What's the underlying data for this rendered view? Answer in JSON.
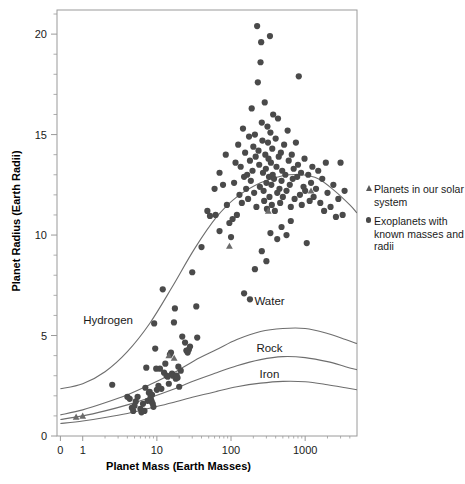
{
  "chart_data": {
    "type": "scatter",
    "title": "",
    "xlabel": "Planet Mass (Earth Masses)",
    "ylabel": "Planet Radius (Earth Radii)",
    "xscale": "log",
    "yscale": "linear",
    "xlim": [
      0.45,
      5000
    ],
    "ylim": [
      0,
      21.2
    ],
    "grid": false,
    "legend_position": "right-outside",
    "xticks": [
      {
        "value": 0.5,
        "label": "0"
      },
      {
        "value": 1,
        "label": "1"
      },
      {
        "value": 10,
        "label": "10"
      },
      {
        "value": 100,
        "label": "100"
      },
      {
        "value": 1000,
        "label": "1000"
      }
    ],
    "yticks_major": [
      {
        "value": 0,
        "label": "0"
      },
      {
        "value": 5,
        "label": "5"
      },
      {
        "value": 10,
        "label": "10"
      },
      {
        "value": 15,
        "label": "15"
      },
      {
        "value": 20,
        "label": "20"
      }
    ],
    "yticks_minor": [
      1,
      2,
      3,
      4,
      6,
      7,
      8,
      9,
      11,
      12,
      13,
      14,
      16,
      17,
      18,
      19,
      21
    ],
    "legend": [
      {
        "marker": "triangle-icon",
        "label": "Planets in our solar system"
      },
      {
        "marker": "circle-icon",
        "label": "Exoplanets with known masses and radii"
      }
    ],
    "annotations": [
      {
        "text": "Hydrogen",
        "x": 2.2,
        "y": 5.6
      },
      {
        "text": "Water",
        "x": 330,
        "y": 6.5
      },
      {
        "text": "Rock",
        "x": 330,
        "y": 4.2
      },
      {
        "text": "Iron",
        "x": 330,
        "y": 2.9
      }
    ],
    "curves": [
      {
        "name": "Hydrogen",
        "points": [
          [
            0.5,
            2.35
          ],
          [
            1,
            2.6
          ],
          [
            2,
            3.2
          ],
          [
            4,
            4.2
          ],
          [
            8,
            5.6
          ],
          [
            16,
            7.4
          ],
          [
            32,
            9.3
          ],
          [
            64,
            10.9
          ],
          [
            120,
            11.9
          ],
          [
            250,
            12.6
          ],
          [
            500,
            12.95
          ],
          [
            900,
            13.0
          ],
          [
            1500,
            12.8
          ],
          [
            2500,
            12.2
          ],
          [
            4000,
            11.5
          ],
          [
            5000,
            11.1
          ]
        ]
      },
      {
        "name": "Water",
        "points": [
          [
            0.5,
            1.05
          ],
          [
            1,
            1.3
          ],
          [
            2,
            1.65
          ],
          [
            4,
            2.05
          ],
          [
            8,
            2.55
          ],
          [
            16,
            3.1
          ],
          [
            32,
            3.75
          ],
          [
            64,
            4.3
          ],
          [
            120,
            4.8
          ],
          [
            250,
            5.2
          ],
          [
            500,
            5.35
          ],
          [
            1000,
            5.35
          ],
          [
            2000,
            5.1
          ],
          [
            3500,
            4.8
          ],
          [
            5000,
            4.6
          ]
        ]
      },
      {
        "name": "Rock",
        "points": [
          [
            0.5,
            0.82
          ],
          [
            1,
            1.0
          ],
          [
            2,
            1.25
          ],
          [
            4,
            1.55
          ],
          [
            8,
            1.9
          ],
          [
            16,
            2.3
          ],
          [
            32,
            2.75
          ],
          [
            64,
            3.15
          ],
          [
            120,
            3.5
          ],
          [
            250,
            3.8
          ],
          [
            500,
            3.95
          ],
          [
            1000,
            3.9
          ],
          [
            2000,
            3.7
          ],
          [
            3500,
            3.45
          ],
          [
            5000,
            3.3
          ]
        ]
      },
      {
        "name": "Iron",
        "points": [
          [
            0.5,
            0.62
          ],
          [
            1,
            0.75
          ],
          [
            2,
            0.92
          ],
          [
            4,
            1.12
          ],
          [
            8,
            1.38
          ],
          [
            16,
            1.65
          ],
          [
            32,
            1.95
          ],
          [
            64,
            2.22
          ],
          [
            120,
            2.45
          ],
          [
            250,
            2.63
          ],
          [
            500,
            2.72
          ],
          [
            1000,
            2.7
          ],
          [
            2000,
            2.55
          ],
          [
            3500,
            2.4
          ],
          [
            5000,
            2.3
          ]
        ]
      }
    ],
    "solar_system_points": [
      [
        0.815,
        0.95
      ],
      [
        1.0,
        1.0
      ],
      [
        14.5,
        4.0
      ],
      [
        17.1,
        3.88
      ],
      [
        95.2,
        9.45
      ],
      [
        317.8,
        11.2
      ],
      [
        1200,
        12.2
      ]
    ],
    "exoplanet_points": [
      [
        2.5,
        2.55
      ],
      [
        4.0,
        1.95
      ],
      [
        4.3,
        1.85
      ],
      [
        4.6,
        1.4
      ],
      [
        4.8,
        1.25
      ],
      [
        5.0,
        1.5
      ],
      [
        5.2,
        1.72
      ],
      [
        5.5,
        1.95
      ],
      [
        6.0,
        1.35
      ],
      [
        6.2,
        1.18
      ],
      [
        6.5,
        1.6
      ],
      [
        6.8,
        1.25
      ],
      [
        7.0,
        2.4
      ],
      [
        7.2,
        3.4
      ],
      [
        7.5,
        1.75
      ],
      [
        7.8,
        2.15
      ],
      [
        8.0,
        2.2
      ],
      [
        8.2,
        1.9
      ],
      [
        8.4,
        1.78
      ],
      [
        8.5,
        1.7
      ],
      [
        8.6,
        2.05
      ],
      [
        8.8,
        1.6
      ],
      [
        9.0,
        1.45
      ],
      [
        9.2,
        5.6
      ],
      [
        9.5,
        4.35
      ],
      [
        9.8,
        3.35
      ],
      [
        10.0,
        2.3
      ],
      [
        10.5,
        2.5
      ],
      [
        11.0,
        3.35
      ],
      [
        11.5,
        2.35
      ],
      [
        12.0,
        7.3
      ],
      [
        12.5,
        3.15
      ],
      [
        13.0,
        3.6
      ],
      [
        13.5,
        3.0
      ],
      [
        14.0,
        2.95
      ],
      [
        14.5,
        2.6
      ],
      [
        15.0,
        4.05
      ],
      [
        15.5,
        4.15
      ],
      [
        16.0,
        3.1
      ],
      [
        16.5,
        3.0
      ],
      [
        17.0,
        5.65
      ],
      [
        17.5,
        6.35
      ],
      [
        18.0,
        2.85
      ],
      [
        18.5,
        3.0
      ],
      [
        19.0,
        2.9
      ],
      [
        20.0,
        2.45
      ],
      [
        22.0,
        4.95
      ],
      [
        24.0,
        4.65
      ],
      [
        25.0,
        4.25
      ],
      [
        26.0,
        4.15
      ],
      [
        27.0,
        4.3
      ],
      [
        30.0,
        8.15
      ],
      [
        34.0,
        6.45
      ],
      [
        40.0,
        9.4
      ],
      [
        48.0,
        11.2
      ],
      [
        52.0,
        10.95
      ],
      [
        60.0,
        12.3
      ],
      [
        70.0,
        13.1
      ],
      [
        78.0,
        12.5
      ],
      [
        85.0,
        14.0
      ],
      [
        95.0,
        10.6
      ],
      [
        100.0,
        9.9
      ],
      [
        110.0,
        12.6
      ],
      [
        115.0,
        13.6
      ],
      [
        120.0,
        11.0
      ],
      [
        125.0,
        14.5
      ],
      [
        130.0,
        12.0
      ],
      [
        135.0,
        13.4
      ],
      [
        140.0,
        11.6
      ],
      [
        145.0,
        15.3
      ],
      [
        150.0,
        12.9
      ],
      [
        155.0,
        14.1
      ],
      [
        160.0,
        12.3
      ],
      [
        165.0,
        13.0
      ],
      [
        170.0,
        11.8
      ],
      [
        175.0,
        14.9
      ],
      [
        180.0,
        13.7
      ],
      [
        185.0,
        12.7
      ],
      [
        190.0,
        16.3
      ],
      [
        195.0,
        13.2
      ],
      [
        200.0,
        14.4
      ],
      [
        205.0,
        12.1
      ],
      [
        210.0,
        15.0
      ],
      [
        215.0,
        13.9
      ],
      [
        220.0,
        11.4
      ],
      [
        225.0,
        20.4
      ],
      [
        230.0,
        17.6
      ],
      [
        235.0,
        14.2
      ],
      [
        240.0,
        13.5
      ],
      [
        245.0,
        12.4
      ],
      [
        250.0,
        18.6
      ],
      [
        255.0,
        19.6
      ],
      [
        260.0,
        15.6
      ],
      [
        265.0,
        14.7
      ],
      [
        270.0,
        13.1
      ],
      [
        275.0,
        12.2
      ],
      [
        280.0,
        11.7
      ],
      [
        285.0,
        16.6
      ],
      [
        290.0,
        14.0
      ],
      [
        295.0,
        13.3
      ],
      [
        300.0,
        12.6
      ],
      [
        305.0,
        11.3
      ],
      [
        310.0,
        15.4
      ],
      [
        315.0,
        14.6
      ],
      [
        320.0,
        13.8
      ],
      [
        325.0,
        12.9
      ],
      [
        330.0,
        11.9
      ],
      [
        335.0,
        19.9
      ],
      [
        340.0,
        15.1
      ],
      [
        345.0,
        13.6
      ],
      [
        350.0,
        12.5
      ],
      [
        355.0,
        11.5
      ],
      [
        360.0,
        14.3
      ],
      [
        365.0,
        13.0
      ],
      [
        370.0,
        16.0
      ],
      [
        380.0,
        12.8
      ],
      [
        390.0,
        11.2
      ],
      [
        400.0,
        14.8
      ],
      [
        410.0,
        13.4
      ],
      [
        420.0,
        12.1
      ],
      [
        430.0,
        15.8
      ],
      [
        440.0,
        13.9
      ],
      [
        450.0,
        12.3
      ],
      [
        460.0,
        11.6
      ],
      [
        470.0,
        14.1
      ],
      [
        480.0,
        12.7
      ],
      [
        490.0,
        13.2
      ],
      [
        500.0,
        11.9
      ],
      [
        520.0,
        14.5
      ],
      [
        540.0,
        13.0
      ],
      [
        560.0,
        12.2
      ],
      [
        580.0,
        15.2
      ],
      [
        600.0,
        13.7
      ],
      [
        620.0,
        12.5
      ],
      [
        640.0,
        11.4
      ],
      [
        660.0,
        14.0
      ],
      [
        680.0,
        12.8
      ],
      [
        700.0,
        13.3
      ],
      [
        720.0,
        11.8
      ],
      [
        750.0,
        14.6
      ],
      [
        780.0,
        12.9
      ],
      [
        800.0,
        13.5
      ],
      [
        820.0,
        17.9
      ],
      [
        850.0,
        12.0
      ],
      [
        880.0,
        13.1
      ],
      [
        900.0,
        11.5
      ],
      [
        950.0,
        12.4
      ],
      [
        980.0,
        13.8
      ],
      [
        1000.0,
        12.2
      ],
      [
        1050.0,
        9.6
      ],
      [
        1100.0,
        13.0
      ],
      [
        1150.0,
        11.7
      ],
      [
        1200.0,
        12.6
      ],
      [
        1250.0,
        13.4
      ],
      [
        1300.0,
        11.9
      ],
      [
        1400.0,
        12.3
      ],
      [
        1500.0,
        13.2
      ],
      [
        1600.0,
        11.6
      ],
      [
        1700.0,
        12.8
      ],
      [
        1800.0,
        11.2
      ],
      [
        1900.0,
        13.6
      ],
      [
        2000.0,
        12.1
      ],
      [
        2200.0,
        11.4
      ],
      [
        2400.0,
        12.5
      ],
      [
        2600.0,
        10.9
      ],
      [
        2800.0,
        11.8
      ],
      [
        3000.0,
        13.6
      ],
      [
        3200.0,
        11.0
      ],
      [
        3400.0,
        12.2
      ],
      [
        150.0,
        7.1
      ],
      [
        180.0,
        6.8
      ],
      [
        210.0,
        8.3
      ],
      [
        260.0,
        9.2
      ],
      [
        300.0,
        8.7
      ],
      [
        340.0,
        10.1
      ],
      [
        420.0,
        9.8
      ],
      [
        480.0,
        10.4
      ],
      [
        560.0,
        10.0
      ],
      [
        640.0,
        10.7
      ],
      [
        70.0,
        10.2
      ],
      [
        88.0,
        11.5
      ],
      [
        105.0,
        10.8
      ],
      [
        62.0,
        11.0
      ],
      [
        35.0,
        4.9
      ],
      [
        28.0,
        4.45
      ],
      [
        21.0,
        3.25
      ],
      [
        19.5,
        3.45
      ]
    ]
  },
  "style": {
    "point_color": "#4a4a4a",
    "triangle_color": "#6b6b6b",
    "curve_color": "#6e6e6e",
    "axis_color": "#9a9a9a",
    "text_color": "#1a1a1a"
  }
}
